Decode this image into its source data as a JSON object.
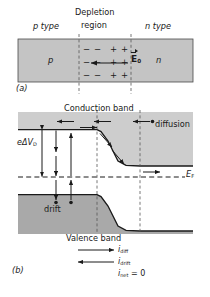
{
  "figure": {
    "panel_a": {
      "caption": "(a)",
      "labels": {
        "p_type": "p type",
        "depletion_line1": "Depletion",
        "depletion_line2": "region",
        "n_type": "n type",
        "p_region": "p",
        "n_region": "n",
        "field": "E",
        "field_sub": "0"
      },
      "charge_rows": [
        [
          "−",
          "−",
          "+",
          "+"
        ],
        [
          "−",
          "−",
          "+",
          "+"
        ],
        [
          "−",
          "−",
          "+",
          "+"
        ]
      ],
      "field_arrow_direction": "left"
    },
    "panel_b": {
      "caption": "(b)",
      "labels": {
        "conduction_band": "Conduction band",
        "valence_band": "Valence band",
        "diffusion": "diffusion",
        "drift": "drift",
        "barrier": "eΔV",
        "barrier_sub": "D",
        "fermi": "E",
        "fermi_sub": "F",
        "i_diff": "i",
        "i_diff_sub": "diff",
        "i_drift": "i",
        "i_drift_sub": "drift",
        "i_net": "i",
        "i_net_sub": "net",
        "i_net_value": "= 0"
      },
      "legend_arrows": [
        {
          "name": "i-diff",
          "direction": "right"
        },
        {
          "name": "i-drift",
          "direction": "left"
        }
      ]
    }
  },
  "chart_data": {
    "type": "line",
    "xlabel": "",
    "ylabel": "Electron energy",
    "grid": false,
    "legend_position": "inline-annotations",
    "x_regions": [
      {
        "name": "p type",
        "x_start": 0,
        "x_end": 0.42
      },
      {
        "name": "depletion region",
        "x_start": 0.42,
        "x_end": 0.72
      },
      {
        "name": "n type",
        "x_start": 0.72,
        "x_end": 1.0
      }
    ],
    "series": [
      {
        "name": "Conduction band edge",
        "x": [
          0.0,
          0.42,
          0.5,
          0.62,
          0.72,
          1.0
        ],
        "values": [
          1.0,
          1.0,
          0.93,
          0.37,
          0.22,
          0.22
        ],
        "style": "solid"
      },
      {
        "name": "Valence band edge",
        "x": [
          0.0,
          0.42,
          0.5,
          0.62,
          0.72,
          1.0
        ],
        "values": [
          0.28,
          0.28,
          0.21,
          -0.35,
          -0.5,
          -0.5
        ],
        "style": "solid"
      },
      {
        "name": "Fermi level E_F",
        "x": [
          0.0,
          1.0
        ],
        "values": [
          0.0,
          0.0
        ],
        "style": "dashed"
      }
    ],
    "annotations": [
      {
        "text": "eΔV_D",
        "meaning": "contact potential energy barrier",
        "x": 0.15,
        "y": 0.6
      },
      {
        "text": "diffusion",
        "meaning": "electron diffusion from n to p",
        "x": 0.86,
        "y": 1.05
      },
      {
        "text": "drift",
        "meaning": "hole/electron drift across junction",
        "x": 0.23,
        "y": -0.25
      },
      {
        "text": "i_diff",
        "meaning": "diffusion current, to the right",
        "x": 0.62,
        "y": -0.95
      },
      {
        "text": "i_drift",
        "meaning": "drift current, to the left",
        "x": 0.62,
        "y": -1.05
      },
      {
        "text": "i_net = 0",
        "meaning": "net current is zero at equilibrium",
        "x": 0.62,
        "y": -1.15
      }
    ]
  },
  "colors": {
    "ink": "#1a1a1a",
    "band_fill_light": "#c9c9c9",
    "band_fill_dark": "#a8a8a8",
    "slab_fill": "#c4c4c4",
    "background": "#ffffff"
  }
}
